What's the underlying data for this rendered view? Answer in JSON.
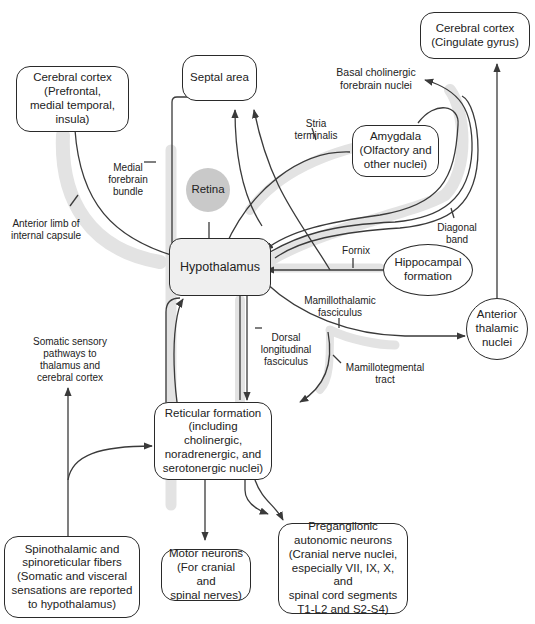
{
  "nodes": {
    "cortex_prefrontal": "Cerebral cortex\n(Prefrontal,\nmedial temporal,\ninsula)",
    "septal": "Septal area",
    "cortex_cingulate": "Cerebral cortex\n(Cingulate gyrus)",
    "retina": "Retina",
    "amygdala": "Amygdala\n(Olfactory and\nother nuclei)",
    "hypothalamus": "Hypothalamus",
    "hippocampal": "Hippocampal\nformation",
    "anterior_thalamic": "Anterior\nthalamic\nnuclei",
    "reticular": "Reticular formation\n(including cholinergic,\nnoradrenergic, and\nserotonergic nuclei)",
    "spinothalamic": "Spinothalamic and\nspinoreticular fibers\n(Somatic and visceral\nsensations are reported\nto hypothalamus)",
    "motor": "Motor neurons\n(For cranial and\nspinal nerves)",
    "preganglionic": "Preganglionic\nautonomic neurons\n(Cranial nerve nuclei,\nespecially VII, IX, X, and\nspinal cord segments\nT1-L2 and S2-S4)"
  },
  "labels": {
    "basal_cholinergic": "Basal cholinergic\nforebrain nuclei",
    "stria_terminalis": "Stria\nterminalis",
    "medial_forebrain": "Medial\nforebrain\nbundle",
    "anterior_limb": "Anterior limb of\ninternal capsule",
    "diagonal_band": "Diagonal\nband",
    "fornix": "Fornix",
    "mamillothalamic": "Mamillothalamic\nfasciculus",
    "dorsal_longitudinal": "Dorsal\nlongitudinal\nfasciculus",
    "mamillotegmental": "Mamillotegmental\ntract",
    "somatic_sensory": "Somatic sensory\npathways to\nthalamus and\ncerebral cortex"
  },
  "colors": {
    "line": "#3a3a3a",
    "tract_shade": "#e3e3e3",
    "hypothalamus_fill": "#efefef",
    "retina_fill": "#c9c9c9"
  }
}
